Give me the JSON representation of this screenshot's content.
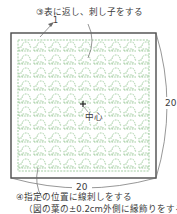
{
  "diagram": {
    "step3_label": "③表に返し、刺し子をする",
    "leader_1_label": "1",
    "center_label": "中心",
    "dim_right_label": "20",
    "dim_bottom_label": "20",
    "step4_label": "④指定の位置に線刺しをする",
    "step4_note": "（図の葉の±0.2cm外側に縁飾りをする",
    "colors": {
      "frame": "#4a4a4a",
      "stitch_pattern": "#8cc08a",
      "leader_lines": "#6a6a6a",
      "text": "#3c3c3c"
    },
    "frame": {
      "x": 11,
      "y": 33,
      "width": 145,
      "height": 145
    },
    "pattern_area": {
      "x": 18,
      "y": 40,
      "width": 131,
      "height": 131
    }
  }
}
